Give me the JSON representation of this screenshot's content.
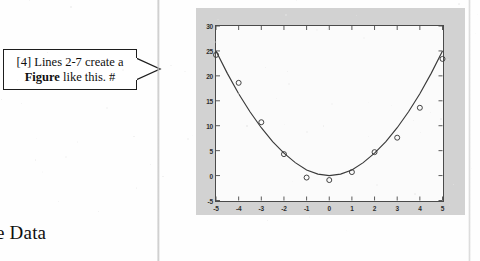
{
  "page": {
    "background_color": "#fefefe",
    "caption_fragment": "e Data"
  },
  "callout": {
    "name": "figure-annotation-callout",
    "line1": "[4] Lines 2-7 create a",
    "line2_bold": "Figure",
    "line2_rest": " like this.  #",
    "border_color": "#1d1d1d",
    "fill_color": "#ffffff"
  },
  "figure_panel": {
    "background_color": "#d2d2d2",
    "axes_background": "#fbfbfb",
    "axes_border_color": "#4a4a4a"
  },
  "chart_data": {
    "type": "scatter",
    "title": "",
    "xlabel": "",
    "ylabel": "",
    "xlim": [
      -5,
      5
    ],
    "ylim": [
      -5,
      30
    ],
    "xticks": [
      "-5",
      "-4",
      "-3",
      "-2",
      "-1",
      "0",
      "1",
      "2",
      "3",
      "4",
      "5"
    ],
    "yticks": [
      "-5",
      "0",
      "5",
      "10",
      "15",
      "20",
      "25",
      "30"
    ],
    "grid": false,
    "legend": "none",
    "marker": "open-circle",
    "marker_color": "#3a3a3a",
    "line_color": "#3a3a3a",
    "series": [
      {
        "name": "data points",
        "type": "scatter",
        "x": [
          -5,
          -4,
          -3,
          -2,
          -1,
          0,
          1,
          2,
          3,
          4,
          5
        ],
        "values": [
          24.2,
          18.6,
          10.7,
          4.3,
          -0.4,
          -0.9,
          0.7,
          4.7,
          7.6,
          13.6,
          23.4
        ]
      },
      {
        "name": "fitted curve",
        "type": "line",
        "x": [
          -5,
          -4.5,
          -4,
          -3.5,
          -3,
          -2.5,
          -2,
          -1.5,
          -1,
          -0.5,
          0,
          0.5,
          1,
          1.5,
          2,
          2.5,
          3,
          3.5,
          4,
          4.5,
          5
        ],
        "values": [
          25.0,
          20.5,
          16.4,
          12.8,
          9.6,
          6.8,
          4.5,
          2.6,
          1.1,
          0.3,
          0.0,
          0.3,
          1.1,
          2.6,
          4.5,
          6.8,
          9.6,
          12.8,
          16.4,
          20.5,
          25.0
        ]
      }
    ]
  }
}
